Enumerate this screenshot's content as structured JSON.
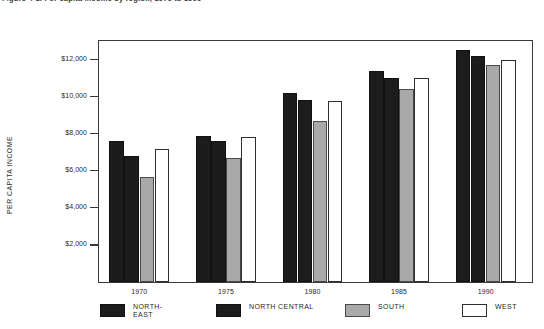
{
  "caption": {
    "text": "Figure 4-1. Per capita income by region, 1970 to 1990"
  },
  "axes": {
    "ylabel": "PER CAPITA INCOME",
    "yticks": [
      "$2,000",
      "$4,000",
      "$6,000",
      "$8,000",
      "$10,000",
      "$12,000"
    ],
    "xticks": [
      "1970",
      "1975",
      "1980",
      "1985",
      "1990"
    ]
  },
  "legend": [
    {
      "label": "NORTH-\nEAST",
      "swatch": "solid-black",
      "series": 0
    },
    {
      "label": "NORTH CENTRAL",
      "swatch": "solid-black",
      "series": 1
    },
    {
      "label": "SOUTH",
      "swatch": "gray",
      "series": 2
    },
    {
      "label": "WEST",
      "swatch": "white-outline",
      "series": 3
    }
  ],
  "colors": {
    "northeast": "#1c1c1c",
    "north_central": "#1c1c1c",
    "south": "#a9a9a9",
    "west": "#ffffff",
    "axis": "#3a3a3a"
  },
  "chart_data": {
    "type": "bar",
    "title": "Per capita income by region, 1970 to 1990",
    "xlabel": "",
    "ylabel": "PER CAPITA INCOME",
    "categories": [
      "1970",
      "1975",
      "1980",
      "1985",
      "1990"
    ],
    "series": [
      {
        "name": "NORTH-EAST",
        "values": [
          7600,
          7900,
          10200,
          11400,
          12500
        ]
      },
      {
        "name": "NORTH CENTRAL",
        "values": [
          6800,
          7600,
          9800,
          11000,
          12200
        ]
      },
      {
        "name": "SOUTH",
        "values": [
          5650,
          6700,
          8700,
          10400,
          11700
        ]
      },
      {
        "name": "WEST",
        "values": [
          7200,
          7800,
          9750,
          11000,
          12000
        ]
      }
    ],
    "ylim": [
      0,
      13000
    ],
    "ytick_values": [
      2000,
      4000,
      6000,
      8000,
      10000,
      12000
    ],
    "grid": false,
    "legend_position": "below"
  }
}
